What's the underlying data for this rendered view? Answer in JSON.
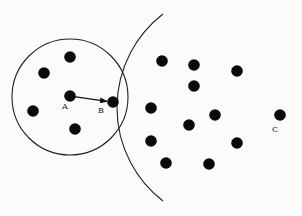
{
  "diagram": {
    "colors": {
      "background": "#fbfbfa",
      "stroke": "#222222",
      "dot": "#0a0a0a"
    },
    "neighborhood_circle": {
      "cx": 70,
      "cy": 97,
      "r": 58
    },
    "large_arc": {
      "path": "M 163 14 A 118 118 0 0 0 163 201"
    },
    "points": [
      {
        "id": "p1",
        "x": 70,
        "y": 57
      },
      {
        "id": "p2",
        "x": 44,
        "y": 73
      },
      {
        "id": "p3",
        "x": 33,
        "y": 111
      },
      {
        "id": "p4",
        "x": 75,
        "y": 129
      },
      {
        "id": "A",
        "x": 70,
        "y": 96,
        "label": "A"
      },
      {
        "id": "B",
        "x": 113,
        "y": 102,
        "label": "B"
      },
      {
        "id": "p5",
        "x": 162,
        "y": 61
      },
      {
        "id": "p6",
        "x": 194,
        "y": 65
      },
      {
        "id": "p7",
        "x": 237,
        "y": 71
      },
      {
        "id": "p8",
        "x": 194,
        "y": 86
      },
      {
        "id": "p9",
        "x": 151,
        "y": 108
      },
      {
        "id": "p10",
        "x": 215,
        "y": 115
      },
      {
        "id": "p11",
        "x": 189,
        "y": 125
      },
      {
        "id": "p12",
        "x": 151,
        "y": 141
      },
      {
        "id": "p13",
        "x": 237,
        "y": 143
      },
      {
        "id": "p14",
        "x": 166,
        "y": 163
      },
      {
        "id": "p15",
        "x": 209,
        "y": 164
      },
      {
        "id": "C",
        "x": 280,
        "y": 115,
        "label": "C"
      }
    ],
    "labels": {
      "A": {
        "text": "A",
        "x": 62,
        "y": 109
      },
      "B": {
        "text": "B",
        "x": 98,
        "y": 113
      },
      "C": {
        "text": "C",
        "x": 272,
        "y": 132
      }
    },
    "arrow": {
      "from": "A",
      "to": "B",
      "x1": 74,
      "y1": 96.6,
      "x2": 107,
      "y2": 101.4
    }
  }
}
